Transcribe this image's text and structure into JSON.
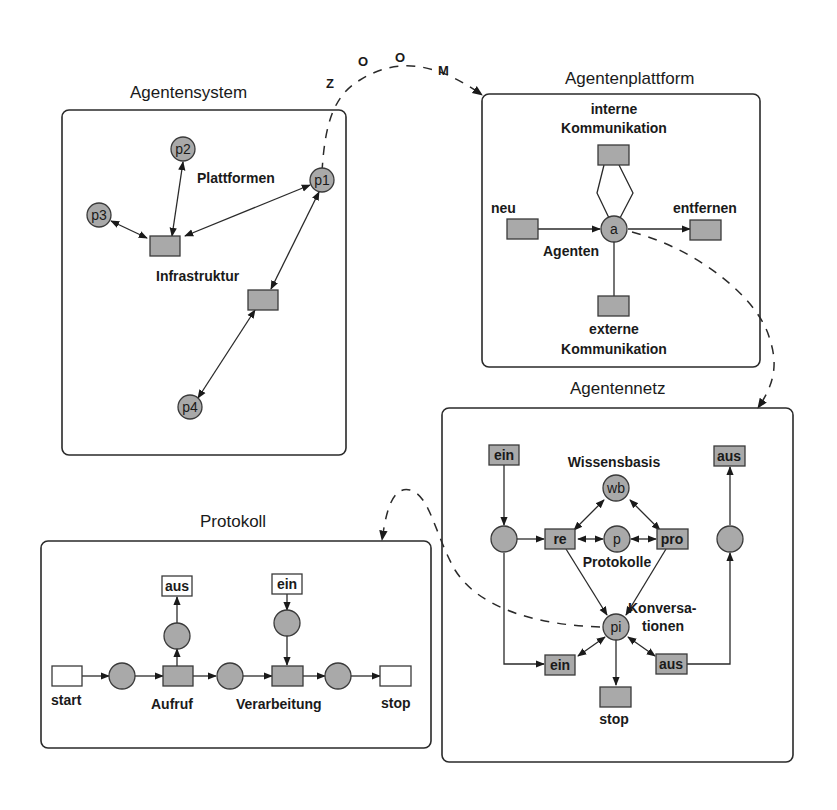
{
  "zoom_label": [
    "Z",
    "O",
    "O",
    "M"
  ],
  "colors": {
    "node_fill": "#a9a9a9",
    "stroke": "#2a2a2a",
    "background": "#ffffff"
  },
  "agentensystem": {
    "title": "Agentensystem",
    "places": [
      "p1",
      "p2",
      "p3",
      "p4"
    ],
    "label_platforms": "Plattformen",
    "label_infrastructure": "Infrastruktur"
  },
  "agentenplattform": {
    "title": "Agentenplattform",
    "label_internal_1": "interne",
    "label_internal_2": "Kommunikation",
    "label_new": "neu",
    "label_remove": "entfernen",
    "place_agents": "a",
    "label_agents": "Agenten",
    "label_external_1": "externe",
    "label_external_2": "Kommunikation"
  },
  "agentennetz": {
    "title": "Agentennetz",
    "in_top": "ein",
    "out_top": "aus",
    "label_knowledge": "Wissensbasis",
    "place_wb": "wb",
    "trans_re": "re",
    "place_p": "p",
    "trans_pro": "pro",
    "label_protocols": "Protokolle",
    "label_conversations_1": "Konversa-",
    "label_conversations_2": "tionen",
    "place_pi": "pi",
    "in_bottom": "ein",
    "out_bottom": "aus",
    "label_stop": "stop"
  },
  "protokoll": {
    "title": "Protokoll",
    "label_start": "start",
    "label_call": "Aufruf",
    "label_processing": "Verarbeitung",
    "label_stop": "stop",
    "out_box": "aus",
    "in_box": "ein"
  }
}
